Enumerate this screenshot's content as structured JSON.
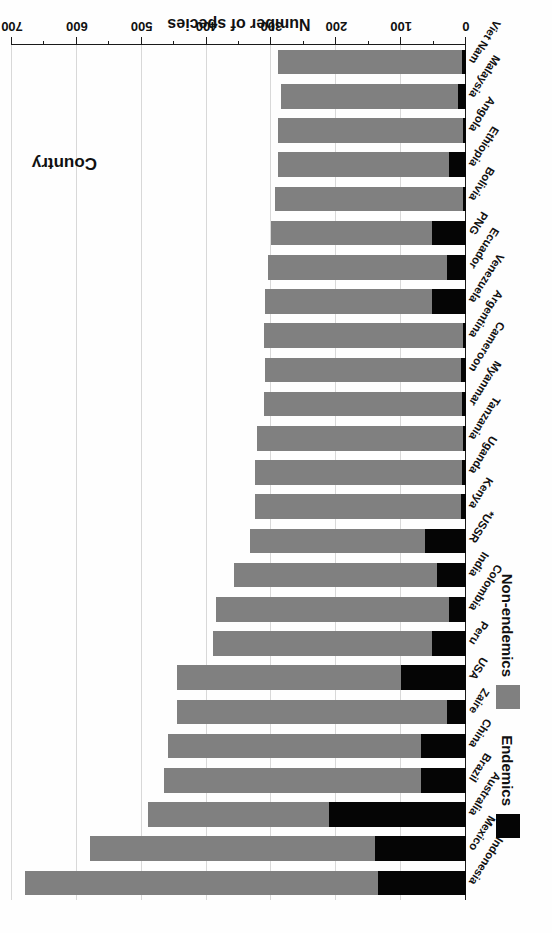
{
  "chart_data": {
    "type": "bar",
    "orientation": "horizontal",
    "title": "",
    "xlabel": "Number of species",
    "ylabel": "Country",
    "xlim": [
      0,
      700
    ],
    "grid": true,
    "grid_axis": "x",
    "legend_position": "left",
    "tick_step_major": 100,
    "tick_step_minor": 50,
    "tick_labels": [
      "0",
      "100",
      "200",
      "300",
      "400",
      "500",
      "600",
      "700"
    ],
    "tick_values": [
      0,
      100,
      200,
      300,
      400,
      500,
      600,
      700
    ],
    "legend": [
      {
        "name": "Endemics",
        "color": "#050505"
      },
      {
        "name": "Non-endemics",
        "color": "#808080"
      }
    ],
    "categories": [
      "Indonesia",
      "Mexico",
      "Australia",
      "Brazil",
      "China",
      "Zaire",
      "USA",
      "Peru",
      "Colombia",
      "India",
      "*USSR",
      "Kenya",
      "Uganda",
      "Tanzania",
      "Myanmar",
      "Cameroon",
      "Argentina",
      "Venezuela",
      "Ecuador",
      "PNG",
      "Bolivia",
      "Ethiopia",
      "Angola",
      "Malaysia",
      "Viet Nam"
    ],
    "series": [
      {
        "name": "Endemics",
        "color": "#050505",
        "values": [
          135,
          140,
          212,
          70,
          70,
          30,
          100,
          52,
          26,
          45,
          63,
          8,
          6,
          5,
          6,
          7,
          5,
          52,
          30,
          52,
          5,
          26,
          5,
          12,
          6
        ]
      },
      {
        "name": "Non-endemics",
        "color": "#808080",
        "values": [
          545,
          440,
          278,
          395,
          390,
          415,
          345,
          338,
          359,
          313,
          270,
          317,
          319,
          317,
          306,
          303,
          307,
          258,
          275,
          248,
          290,
          264,
          285,
          273,
          284
        ]
      }
    ],
    "totals": [
      680,
      580,
      490,
      465,
      460,
      445,
      445,
      390,
      385,
      358,
      333,
      325,
      325,
      322,
      312,
      310,
      312,
      310,
      305,
      300,
      295,
      290,
      290,
      285,
      290
    ],
    "footnote": "*USSR"
  }
}
